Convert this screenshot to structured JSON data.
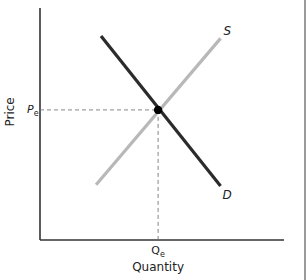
{
  "chart_data": {
    "type": "line",
    "title": "",
    "xlabel": "Quantity",
    "ylabel": "Price",
    "xlim": [
      0,
      10
    ],
    "ylim": [
      0,
      10
    ],
    "grid": false,
    "legend": "none (curves labeled at ends)",
    "series": [
      {
        "name": "Demand",
        "label": "D",
        "color": "#2b2b2b",
        "points": [
          [
            2.5,
            8.5
          ],
          [
            7.4,
            2.25
          ]
        ]
      },
      {
        "name": "Supply",
        "label": "S",
        "color": "#b8b8b8",
        "points": [
          [
            2.3,
            2.3
          ],
          [
            7.4,
            8.4
          ]
        ]
      }
    ],
    "equilibrium": {
      "q": 4.84,
      "p": 5.42,
      "q_label": "Q",
      "q_label_sub": "e",
      "p_label": "P",
      "p_label_sub": "e",
      "color": "#000000"
    },
    "guide_lines": "dashed from equilibrium to both axes",
    "tick_labels": {
      "x": [
        "Qe"
      ],
      "y": [
        "Pe"
      ]
    }
  }
}
